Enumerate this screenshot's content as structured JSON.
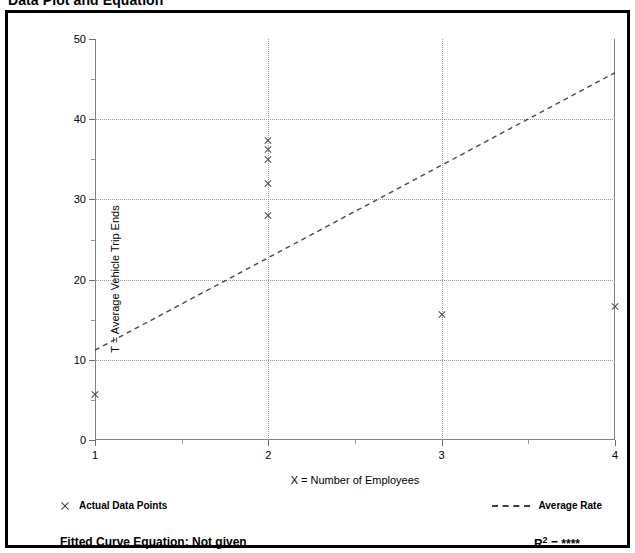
{
  "page": {
    "title": "Data Plot and Equation"
  },
  "legend": {
    "points_label": "Actual Data Points",
    "points_marker_icon": "x-marker-icon",
    "rate_label": "Average Rate",
    "rate_swatch_icon": "dashed-line-icon"
  },
  "footer": {
    "fitted_equation": "Fitted Curve Equation:  Not given",
    "r_squared_symbol": "R",
    "r_squared_exponent": "2",
    "r_squared_value": "= ****"
  },
  "chart_data": {
    "type": "scatter",
    "title": "Data Plot and Equation",
    "xlabel": "X = Number of Employees",
    "ylabel": "T = Average Vehicle Trip Ends",
    "xlim": [
      1,
      4
    ],
    "ylim": [
      0,
      50
    ],
    "xticks": [
      1,
      2,
      3,
      4
    ],
    "xtick_labels": [
      "1",
      "2",
      "3",
      "4"
    ],
    "xticks_minor": [
      1.5,
      2.5,
      3.5
    ],
    "yticks": [
      0,
      10,
      20,
      30,
      40,
      50
    ],
    "ytick_labels": [
      "0",
      "10",
      "20",
      "30",
      "40",
      "50"
    ],
    "yticks_minor": [
      5,
      15,
      25,
      35,
      45
    ],
    "grid": true,
    "grid_style": "dotted",
    "grid_x": [
      2,
      3
    ],
    "grid_y": [
      10,
      20,
      30,
      40
    ],
    "legend_position": "below-axes",
    "series": [
      {
        "name": "Actual Data Points",
        "type": "scatter",
        "marker": "x",
        "color": "#4a4a4a",
        "points": [
          {
            "x": 1,
            "y": 5.7
          },
          {
            "x": 2,
            "y": 28.0
          },
          {
            "x": 2,
            "y": 32.0
          },
          {
            "x": 2,
            "y": 35.0
          },
          {
            "x": 2,
            "y": 36.2
          },
          {
            "x": 2,
            "y": 37.3
          },
          {
            "x": 3,
            "y": 15.7
          },
          {
            "x": 4,
            "y": 16.7
          }
        ]
      },
      {
        "name": "Average Rate",
        "type": "line",
        "linestyle": "dashed",
        "color": "#4a4a4a",
        "points": [
          {
            "x": 1,
            "y": 11.2
          },
          {
            "x": 4,
            "y": 45.8
          }
        ]
      }
    ]
  }
}
